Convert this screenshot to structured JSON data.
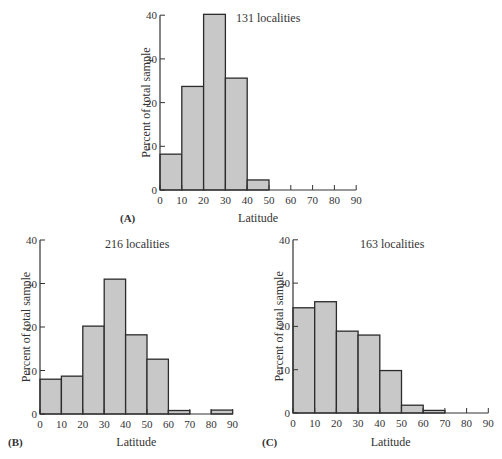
{
  "chart_data": [
    {
      "type": "bar",
      "panel": "(A)",
      "annotation": "131 localities",
      "title": "",
      "xlabel": "Latitude",
      "ylabel": "Percent of total sample",
      "x_ticks": [
        0,
        10,
        20,
        30,
        40,
        50,
        60,
        70,
        80,
        90
      ],
      "y_ticks": [
        0,
        10,
        20,
        30,
        40
      ],
      "xlim": [
        0,
        90
      ],
      "ylim": [
        0,
        40
      ],
      "grid": false,
      "categories": [
        "0-10",
        "10-20",
        "20-30",
        "30-40",
        "40-50",
        "50-60",
        "60-70",
        "70-80",
        "80-90"
      ],
      "values": [
        8.2,
        23.7,
        40.2,
        25.6,
        2.3,
        0,
        0,
        0,
        0
      ]
    },
    {
      "type": "bar",
      "panel": "(B)",
      "annotation": "216 localities",
      "title": "",
      "xlabel": "Latitude",
      "ylabel": "Percent of total sample",
      "x_ticks": [
        0,
        10,
        20,
        30,
        40,
        50,
        60,
        70,
        80,
        90
      ],
      "y_ticks": [
        0,
        10,
        20,
        30,
        40
      ],
      "xlim": [
        0,
        90
      ],
      "ylim": [
        0,
        40
      ],
      "grid": false,
      "categories": [
        "0-10",
        "10-20",
        "20-30",
        "30-40",
        "40-50",
        "50-60",
        "60-70",
        "70-80",
        "80-90"
      ],
      "values": [
        8.0,
        8.7,
        20.2,
        31.0,
        18.2,
        12.6,
        0.8,
        0,
        0.9
      ]
    },
    {
      "type": "bar",
      "panel": "(C)",
      "annotation": "163 localities",
      "title": "",
      "xlabel": "Latitude",
      "ylabel": "Percent of total sample",
      "x_ticks": [
        0,
        10,
        20,
        30,
        40,
        50,
        60,
        70,
        80,
        90
      ],
      "y_ticks": [
        0,
        10,
        20,
        30,
        40
      ],
      "xlim": [
        0,
        90
      ],
      "ylim": [
        0,
        40
      ],
      "grid": false,
      "categories": [
        "0-10",
        "10-20",
        "20-30",
        "30-40",
        "40-50",
        "50-60",
        "60-70",
        "70-80",
        "80-90"
      ],
      "values": [
        24.3,
        25.7,
        18.9,
        18.0,
        9.8,
        1.8,
        0.6,
        0,
        0
      ]
    }
  ],
  "style": {
    "bar_fill": "#c8c8c8",
    "bar_stroke": "#2b2b2b",
    "axis_color": "#333333"
  },
  "layout": [
    {
      "x0": 160,
      "y0": 190,
      "xscale": 2.18,
      "yscale": 4.37,
      "ylabel_x": 150,
      "label_x": 120,
      "label_y": 208,
      "xlabel_x": 240,
      "note_x": 236,
      "note_y": 10
    },
    {
      "x0": 40,
      "y0": 414,
      "xscale": 2.14,
      "yscale": 4.35,
      "ylabel_x": 30,
      "label_x": 8,
      "label_y": 432,
      "xlabel_x": 118,
      "note_x": 105,
      "note_y": 236
    },
    {
      "x0": 293,
      "y0": 413,
      "xscale": 2.17,
      "yscale": 4.33,
      "ylabel_x": 283,
      "label_x": 262,
      "label_y": 432,
      "xlabel_x": 371,
      "note_x": 360,
      "note_y": 236
    }
  ]
}
